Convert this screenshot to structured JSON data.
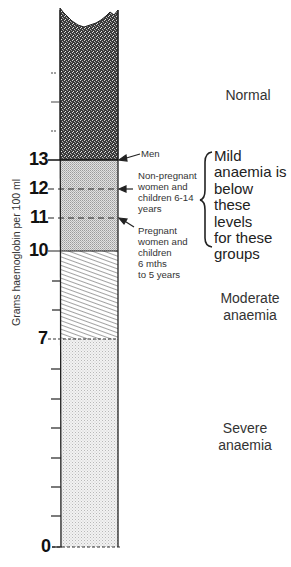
{
  "diagram": {
    "y_axis_label": "Grams haemoglobin per 100 ml",
    "scale": {
      "min": 0,
      "max": 13,
      "unit": "g/100 ml",
      "labeled_ticks": [
        13,
        12,
        11,
        10,
        7,
        0
      ],
      "unlabeled_ticks": [
        14,
        15,
        16,
        6,
        5,
        4,
        3,
        2,
        1
      ]
    },
    "tick_labels": {
      "t13": "13",
      "t12": "12",
      "t11": "11",
      "t10": "10",
      "t7": "7",
      "t0": "0"
    },
    "zones": [
      {
        "id": "normal",
        "label": "Normal",
        "range": "above 13",
        "pattern": "dense-dark-stipple"
      },
      {
        "id": "mild",
        "label": "Mild anaemia",
        "range": "10-13",
        "pattern": "fine-grey-crosshatch"
      },
      {
        "id": "moderate",
        "label": "Moderate anaemia",
        "range": "7-10",
        "pattern": "diagonal-hatch"
      },
      {
        "id": "severe",
        "label": "Severe anaemia",
        "range": "0-7",
        "pattern": "light-dot-stipple"
      }
    ],
    "zone_labels": {
      "normal": "Normal",
      "moderate_line1": "Moderate",
      "moderate_line2": "anaemia",
      "severe_line1": "Severe",
      "severe_line2": "anaemia"
    },
    "thresholds": [
      {
        "value": 13,
        "group": "Men"
      },
      {
        "value": 12,
        "group": "Non-pregnant women and children 6-14 years"
      },
      {
        "value": 11,
        "group": "Pregnant women and children 6 mths to 5 years"
      }
    ],
    "group_labels": {
      "men": "Men",
      "nonpreg": [
        "Non-pregnant",
        "women and",
        "children 6-14",
        "years"
      ],
      "preg": [
        "Pregnant",
        "women and",
        "children",
        "6 mths",
        "to 5 years"
      ]
    },
    "mild_note": [
      "Mild",
      "anaemia is",
      "below",
      "these levels",
      "for these",
      "groups"
    ]
  },
  "colors": {
    "ink": "#222222",
    "background": "#ffffff",
    "mild_fill": "#cfcfcf",
    "severe_fill": "#e9e9e9"
  }
}
